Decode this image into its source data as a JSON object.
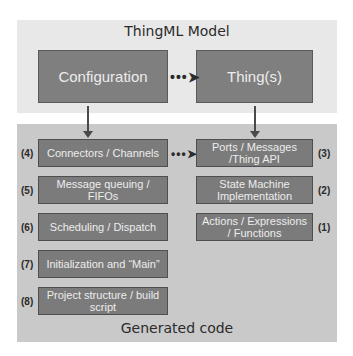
{
  "top_panel": {
    "title": "ThingML Model"
  },
  "model_boxes": {
    "configuration": "Configuration",
    "things": "Thing(s)"
  },
  "bottom_panel": {
    "title": "Generated code"
  },
  "left_boxes": [
    {
      "num": "(4)",
      "label": "Connectors / Channels"
    },
    {
      "num": "(5)",
      "label": "Message queuing / FIFOs"
    },
    {
      "num": "(6)",
      "label": "Scheduling / Dispatch"
    },
    {
      "num": "(7)",
      "label": "Initialization and “Main”"
    },
    {
      "num": "(8)",
      "label": "Project structure / build script"
    }
  ],
  "right_boxes": [
    {
      "num": "(3)",
      "label": "Ports / Messages /Thing API"
    },
    {
      "num": "(2)",
      "label": "State Machine Implementation"
    },
    {
      "num": "(1)",
      "label": "Actions / Expressions / Functions"
    }
  ],
  "connectors": {
    "dotted_arrow": "•••➤"
  },
  "colors": {
    "top_panel": "#e8e8e8",
    "bottom_panel": "#c9c9c9",
    "box_fill": "#7b7b7b",
    "box_text": "#ededed"
  }
}
